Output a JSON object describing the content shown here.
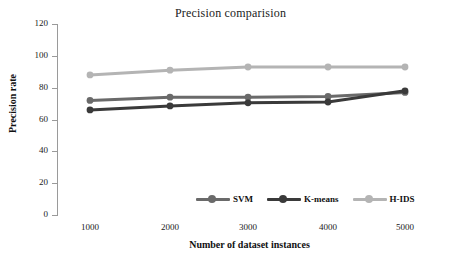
{
  "chart_data": {
    "type": "line",
    "title": "Precision comparision",
    "xlabel": "Number of dataset instances",
    "ylabel": "Precision rate",
    "categories": [
      1000,
      2000,
      3000,
      4000,
      5000
    ],
    "x": [
      1000,
      2000,
      3000,
      4000,
      5000
    ],
    "xtick_labels": [
      "1000",
      "2000",
      "3000",
      "4000",
      "5000"
    ],
    "ytick_labels": [
      "0",
      "20",
      "40",
      "60",
      "80",
      "100",
      "120"
    ],
    "yticks": [
      0,
      20,
      40,
      60,
      80,
      100,
      120
    ],
    "ylim": [
      0,
      120
    ],
    "xlim": [
      1000,
      5000
    ],
    "grid": false,
    "legend_position": "bottom-center",
    "series": [
      {
        "name": "SVM",
        "color": "#6a6a6a",
        "values": [
          72,
          74,
          74,
          74.5,
          77
        ]
      },
      {
        "name": "K-means",
        "color": "#3a3a3a",
        "values": [
          66,
          68.5,
          70.5,
          71,
          78
        ]
      },
      {
        "name": "H-IDS",
        "color": "#b4b4b4",
        "values": [
          88,
          91,
          93,
          93,
          93
        ]
      }
    ]
  },
  "legend": {
    "items": [
      {
        "label": "SVM",
        "color": "#6a6a6a"
      },
      {
        "label": "K-means",
        "color": "#3a3a3a"
      },
      {
        "label": "H-IDS",
        "color": "#b4b4b4"
      }
    ]
  },
  "axis": {
    "y_title": "Precision rate",
    "x_title": "Number of dataset instances",
    "y_labels": [
      "120",
      "100",
      "80",
      "60",
      "40",
      "20",
      "0"
    ],
    "x_labels": [
      "1000",
      "2000",
      "3000",
      "4000",
      "5000"
    ]
  },
  "colors": {
    "axis": "#9a9a9a",
    "text": "#111111",
    "background": "#ffffff"
  }
}
